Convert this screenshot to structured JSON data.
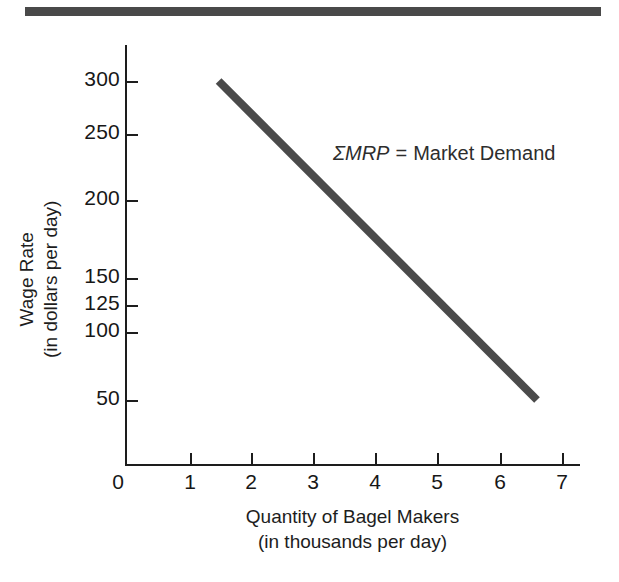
{
  "figure": {
    "top_rule_color": "#494949",
    "background": "#ffffff"
  },
  "chart_data": {
    "type": "line",
    "title": "",
    "xlabel": "Quantity of Bagel Makers",
    "xlabel_sub": "(in thousands per day)",
    "ylabel": "Wage Rate",
    "ylabel_sub": "(in dollars per day)",
    "xlim": [
      0,
      7.3
    ],
    "ylim": [
      0,
      320
    ],
    "grid": false,
    "legend": "none",
    "x_ticks": [
      "0",
      "1",
      "2",
      "3",
      "4",
      "5",
      "6",
      "7"
    ],
    "x_tick_values": [
      0,
      1,
      2,
      3,
      4,
      5,
      6,
      7
    ],
    "y_ticks": [
      "300",
      "250",
      "200",
      "150",
      "125",
      "100",
      "50"
    ],
    "y_tick_values": [
      300,
      250,
      200,
      150,
      125,
      100,
      50
    ],
    "series": [
      {
        "name": "Market Demand",
        "color": "#4a4a4a",
        "line_width": 8,
        "points": [
          {
            "x": 1.5,
            "y": 300
          },
          {
            "x": 6.6,
            "y": 50
          }
        ]
      }
    ],
    "annotations": [
      {
        "name": "market-demand-label",
        "symbol": "ΣMRP",
        "equals": "=",
        "text": "Market Demand",
        "x": 4.35,
        "y": 237
      }
    ]
  },
  "axes": {
    "y_tick_labels": [
      {
        "label": "300",
        "px": 81
      },
      {
        "label": "250",
        "px": 134
      },
      {
        "label": "200",
        "px": 200
      },
      {
        "label": "150",
        "px": 278
      },
      {
        "label": "125",
        "px": 305
      },
      {
        "label": "100",
        "px": 332
      },
      {
        "label": "50",
        "px": 400
      }
    ],
    "x_tick_labels": [
      {
        "label": "0",
        "px": 118
      },
      {
        "label": "1",
        "px": 190
      },
      {
        "label": "2",
        "px": 251
      },
      {
        "label": "3",
        "px": 313
      },
      {
        "label": "4",
        "px": 375
      },
      {
        "label": "5",
        "px": 437
      },
      {
        "label": "6",
        "px": 500
      },
      {
        "label": "7",
        "px": 562
      }
    ]
  }
}
